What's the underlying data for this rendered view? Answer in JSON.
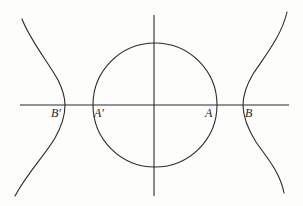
{
  "figure": {
    "colors": {
      "ink": "#2a2a2a",
      "paper": "#fdfdfc"
    },
    "axes": {
      "horizontal": {
        "x1": 20,
        "x2": 289,
        "y": 105
      },
      "vertical": {
        "x": 154,
        "y1": 15,
        "y2": 196
      }
    },
    "circle": {
      "cx": 155,
      "cy": 105,
      "r": 62
    },
    "curves": {
      "left": {
        "vertex": [
          65,
          105
        ],
        "top_end": [
          22,
          19
        ],
        "bottom_end": [
          15,
          196
        ]
      },
      "right": {
        "vertex": [
          243,
          105
        ],
        "top_end": [
          287,
          12
        ],
        "bottom_end": [
          284,
          193
        ]
      }
    },
    "labels": [
      {
        "id": "B_prime",
        "text": "B′"
      },
      {
        "id": "A_prime",
        "text": "A′"
      },
      {
        "id": "A",
        "text": "A"
      },
      {
        "id": "B",
        "text": "B"
      }
    ]
  }
}
